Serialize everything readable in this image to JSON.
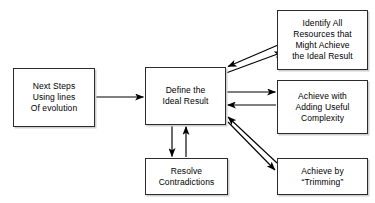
{
  "diagram": {
    "background_color": "#ffffff",
    "line_color": "#000000",
    "box_border_color": "#2b2b2b",
    "box_fill_color": "#ffffff",
    "nodes": [
      {
        "id": "next-steps",
        "label": "Next Steps\nUsing lines\nOf evolution"
      },
      {
        "id": "define",
        "label": "Define the\nIdeal Result"
      },
      {
        "id": "identify",
        "label": "Identify All\nResources that\nMight Achieve\nthe Ideal Result"
      },
      {
        "id": "complexity",
        "label": "Achieve with\nAdding Useful\nComplexity"
      },
      {
        "id": "trimming",
        "label": "Achieve by\n“Trimming”"
      },
      {
        "id": "resolve",
        "label": "Resolve\nContradictions"
      }
    ],
    "edges": [
      {
        "id": "next-steps-to-define",
        "from": "next-steps",
        "to": "define",
        "direction": "right"
      },
      {
        "id": "identify-to-define",
        "from": "identify",
        "to": "define",
        "direction": "down-left"
      },
      {
        "id": "define-to-identify",
        "from": "define",
        "to": "identify",
        "direction": "up-right"
      },
      {
        "id": "define-to-complexity",
        "from": "define",
        "to": "complexity",
        "direction": "right"
      },
      {
        "id": "complexity-to-define",
        "from": "complexity",
        "to": "define",
        "direction": "left"
      },
      {
        "id": "define-to-trimming",
        "from": "define",
        "to": "trimming",
        "direction": "down-right"
      },
      {
        "id": "trimming-to-define",
        "from": "trimming",
        "to": "define",
        "direction": "up-left"
      },
      {
        "id": "define-to-resolve",
        "from": "define",
        "to": "resolve",
        "direction": "down"
      },
      {
        "id": "resolve-to-define",
        "from": "resolve",
        "to": "define",
        "direction": "up"
      }
    ]
  }
}
